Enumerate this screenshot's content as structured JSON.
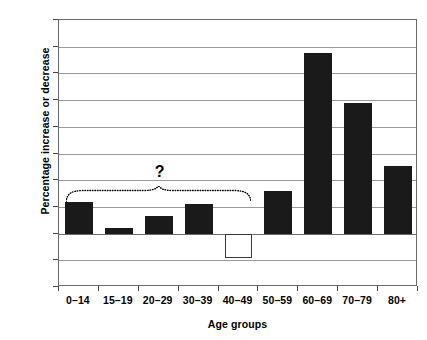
{
  "chart_data": {
    "type": "bar",
    "title": "",
    "subtitle": "",
    "xlabel": "Age groups",
    "ylabel": "Percentage increase or decrease",
    "categories": [
      "0–14",
      "15–19",
      "20–29",
      "30–39",
      "40–49",
      "50–59",
      "60–69",
      "70–79",
      "80+"
    ],
    "values": [
      12,
      2,
      6.5,
      11,
      -9,
      15.8,
      67.5,
      49,
      25.5
    ],
    "series": [
      {
        "name": "Percentage increase or decrease",
        "values": [
          12,
          2,
          6.5,
          11,
          -9,
          15.8,
          67.5,
          49,
          25.5
        ]
      }
    ],
    "bar_fills": [
      "filled",
      "filled",
      "filled",
      "filled",
      "hollow",
      "filled",
      "filled",
      "filled",
      "filled"
    ],
    "ylim": [
      -20,
      80
    ],
    "ytick_values": [
      80,
      70,
      60,
      50,
      40,
      30,
      20,
      10,
      0,
      -10,
      -20
    ],
    "ytick_labels": [
      "80",
      "70",
      "60",
      "50",
      "40",
      "30",
      "20",
      "10",
      "0",
      "–10",
      "–20"
    ],
    "grid": true,
    "grid_axis": "y",
    "legend": false,
    "legend_position": "none",
    "annotations": [
      {
        "type": "text",
        "text": "?",
        "x_category_span": [
          "0–14",
          "40–49"
        ],
        "y_value": 23
      },
      {
        "type": "brace",
        "style": "dotted-curly",
        "x_category_span": [
          "0–14",
          "40–49"
        ],
        "y_value": 17
      }
    ],
    "colors": {
      "bar_fill": "#1a1a1a",
      "bar_hollow_fill": "#ffffff",
      "bar_hollow_stroke": "#3a3a3a",
      "grid": "#9a9a9a",
      "axis": "#6a6a6a",
      "text": "#000000",
      "background": "#ffffff"
    }
  }
}
